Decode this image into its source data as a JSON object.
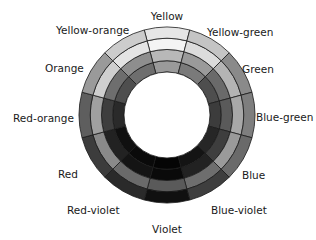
{
  "diagram": {
    "title": "",
    "center": [
      167,
      115
    ],
    "inner_radius": 43,
    "outer_radius": 88,
    "ring_count": 4,
    "segments": [
      {
        "name": "Yellow",
        "label_pos": [
          167,
          20
        ],
        "anchor": "middle",
        "rings": [
          "#9a9a9a",
          "#b8b8b8",
          "#f4f4f4",
          "#e6e6e6"
        ]
      },
      {
        "name": "Yellow-green",
        "label_pos": [
          207,
          36
        ],
        "anchor": "start",
        "rings": [
          "#7a7a7a",
          "#9a9a9a",
          "#dcdcdc",
          "#c4c4c4"
        ]
      },
      {
        "name": "Green",
        "label_pos": [
          242,
          73
        ],
        "anchor": "start",
        "rings": [
          "#4e4e4e",
          "#6a6a6a",
          "#b4b4b4",
          "#8a8a8a"
        ]
      },
      {
        "name": "Blue-green",
        "label_pos": [
          256,
          121
        ],
        "anchor": "start",
        "rings": [
          "#3c3c3c",
          "#5a5a5a",
          "#a8a8a8",
          "#7e7e7e"
        ]
      },
      {
        "name": "Blue",
        "label_pos": [
          242,
          179
        ],
        "anchor": "start",
        "rings": [
          "#262626",
          "#3e3e3e",
          "#9a9a9a",
          "#6a6a6a"
        ]
      },
      {
        "name": "Blue-violet",
        "label_pos": [
          211,
          214
        ],
        "anchor": "start",
        "rings": [
          "#141414",
          "#222222",
          "#6e6e6e",
          "#3e3e3e"
        ]
      },
      {
        "name": "Violet",
        "label_pos": [
          167,
          233
        ],
        "anchor": "middle",
        "rings": [
          "#050505",
          "#0a0a0a",
          "#5a5a5a",
          "#101010"
        ]
      },
      {
        "name": "Red-violet",
        "label_pos": [
          67,
          214
        ],
        "anchor": "start",
        "rings": [
          "#0a0a0a",
          "#141414",
          "#6a6a6a",
          "#2a2a2a"
        ]
      },
      {
        "name": "Red",
        "label_pos": [
          58,
          178
        ],
        "anchor": "start",
        "rings": [
          "#101010",
          "#222222",
          "#8a8a8a",
          "#3c3c3c"
        ]
      },
      {
        "name": "Red-orange",
        "label_pos": [
          13,
          122
        ],
        "anchor": "start",
        "rings": [
          "#2a2a2a",
          "#3e3e3e",
          "#a0a0a0",
          "#5e5e5e"
        ]
      },
      {
        "name": "Orange",
        "label_pos": [
          45,
          72
        ],
        "anchor": "start",
        "rings": [
          "#4e4e4e",
          "#6e6e6e",
          "#cfcfcf",
          "#9a9a9a"
        ]
      },
      {
        "name": "Yellow-orange",
        "label_pos": [
          56,
          34
        ],
        "anchor": "start",
        "rings": [
          "#6e6e6e",
          "#8e8e8e",
          "#e4e4e4",
          "#cccccc"
        ]
      }
    ],
    "stroke_color": "#1a1a1a",
    "hole_color": "#ffffff"
  }
}
